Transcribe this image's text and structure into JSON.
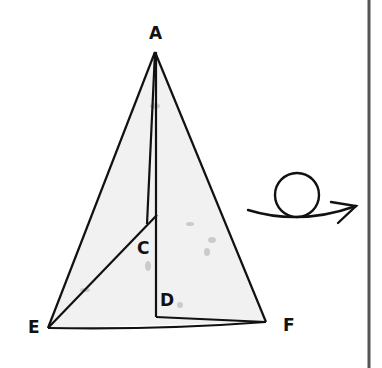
{
  "diagram": {
    "type": "folded-pyramid-net",
    "labels": {
      "A": "A",
      "C": "C",
      "D": "D",
      "E": "E",
      "F": "F"
    },
    "symbol": "rotate-arrow-icon",
    "colors": {
      "stroke": "#111111",
      "fill": "#f1f1f1",
      "border": "#555555"
    }
  }
}
